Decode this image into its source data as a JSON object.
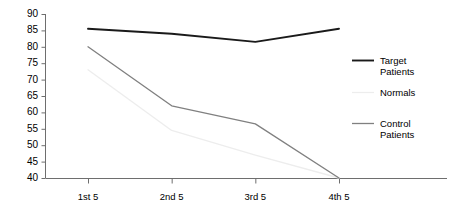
{
  "chart_data": {
    "type": "line",
    "title": "",
    "xlabel": "",
    "ylabel": "",
    "categories": [
      "1st 5",
      "2nd 5",
      "3rd 5",
      "4th 5"
    ],
    "ylim": [
      40,
      90
    ],
    "yticks": [
      40,
      45,
      50,
      55,
      60,
      65,
      70,
      75,
      80,
      85,
      90
    ],
    "grid": false,
    "legend_position": "right",
    "series": [
      {
        "name": "Target Patients",
        "color": "#1a1a1a",
        "values": [
          85.5,
          84.0,
          81.5,
          85.5
        ]
      },
      {
        "name": "Normals",
        "color": "#ededed",
        "values": [
          73.0,
          54.5,
          47.0,
          40.0
        ]
      },
      {
        "name": "Control Patients",
        "color": "#808080",
        "values": [
          80.0,
          62.0,
          56.5,
          40.0
        ]
      }
    ]
  },
  "axis": {
    "y_tick_labels": [
      "90",
      "85",
      "80",
      "75",
      "70",
      "65",
      "60",
      "55",
      "50",
      "45",
      "40"
    ],
    "x_tick_labels": [
      "1st 5",
      "2nd 5",
      "3rd 5",
      "4th 5"
    ]
  },
  "legend": {
    "entries": [
      {
        "label": "Target\nPatients",
        "color": "#1a1a1a",
        "has_swatch": true
      },
      {
        "label": "Normals",
        "color": "#ededed",
        "has_swatch": true
      },
      {
        "label": "Control\nPatients",
        "color": "#808080",
        "has_swatch": true
      }
    ]
  },
  "colors": {
    "axis": "#6e6e6e",
    "text": "#000000",
    "background": "#ffffff",
    "target_patients": "#1a1a1a",
    "normals": "#ededed",
    "control_patients": "#808080"
  }
}
